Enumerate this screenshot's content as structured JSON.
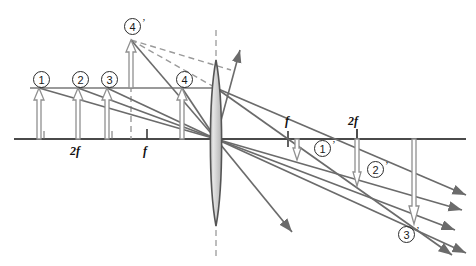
{
  "figure": {
    "type": "optics-ray-diagram",
    "colors": {
      "axis": "#4a4a4a",
      "ray": "#6b6b6b",
      "object": "#8c8c8c",
      "lens_outline": "#555555",
      "lens_fill": "#dedede",
      "dashed": "#9a9a9a",
      "label": "#1a1a1a"
    },
    "canvas": {
      "width": 476,
      "height": 266
    }
  },
  "axis": {
    "y": 139,
    "x_start": 14,
    "x_end": 466,
    "left_ticks": [
      {
        "label": "",
        "x": 44
      },
      {
        "label": "2f",
        "x": 78
      },
      {
        "label": "",
        "x": 112
      },
      {
        "label": "f",
        "x": 147
      },
      {
        "label": "",
        "x": 181
      }
    ],
    "right_ticks": [
      {
        "label": "f",
        "x": 288
      },
      {
        "label": "2f",
        "x": 357
      }
    ],
    "tick_labels": {
      "left_2f": "2f",
      "left_f": "f",
      "right_f": "f",
      "right_2f": "2f"
    }
  },
  "lens": {
    "center_x": 216,
    "top_y": 60,
    "bottom_y": 226,
    "half_width": 7,
    "optical_axis_dash_top": 30,
    "optical_axis_dash_bottom": 256
  },
  "objects": [
    {
      "id": "1",
      "label": "1",
      "prime": false,
      "x": 39,
      "tip_y": 88,
      "base_y": 139,
      "tag_x": 33,
      "tag_y": 71
    },
    {
      "id": "2",
      "label": "2",
      "prime": false,
      "x": 78,
      "tip_y": 88,
      "base_y": 139,
      "tag_x": 72,
      "tag_y": 71
    },
    {
      "id": "3",
      "label": "3",
      "prime": false,
      "x": 107,
      "tip_y": 88,
      "base_y": 139,
      "tag_x": 101,
      "tag_y": 71
    },
    {
      "id": "4",
      "label": "4",
      "prime": false,
      "x": 182,
      "tip_y": 88,
      "base_y": 139,
      "tag_x": 176,
      "tag_y": 71
    }
  ],
  "images": [
    {
      "id": "1p",
      "label": "1",
      "prime": true,
      "x": 297,
      "tip_y": 157,
      "base_y": 139,
      "tag_x": 314,
      "tag_y": 140
    },
    {
      "id": "2p",
      "label": "2",
      "prime": true,
      "x": 357,
      "tip_y": 182,
      "base_y": 139,
      "tag_x": 367,
      "tag_y": 161
    },
    {
      "id": "3p",
      "label": "3",
      "prime": true,
      "x": 414,
      "tip_y": 218,
      "base_y": 139,
      "tag_x": 398,
      "tag_y": 226
    },
    {
      "id": "4p",
      "label": "4",
      "prime": true,
      "x": 131,
      "tip_y": 40,
      "base_y": 139,
      "tag_x": 124,
      "tag_y": 18
    }
  ],
  "rays": {
    "parallel_line_y": 88,
    "parallel_line_x_start": 39,
    "parallel_line_x_end": 216,
    "notes": "Parallel rays from each object tip travel to the lens, then refract through the focal point; chief rays pass undeviated through the lens center."
  },
  "legend": {
    "object_marker": "hollow-arrow-up",
    "image_marker": "hollow-arrow-down",
    "virtual_ray_style": "dashed"
  }
}
